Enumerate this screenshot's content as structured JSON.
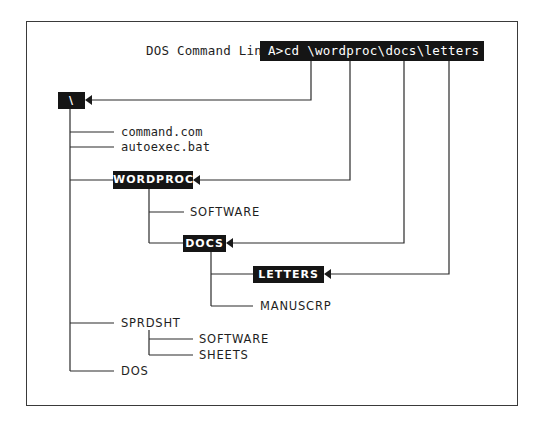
{
  "diagram": {
    "title_label": "DOS Command Line:",
    "command": "A>cd \\wordproc\\docs\\letters",
    "root": {
      "label": "\\"
    },
    "root_files": [
      "command.com",
      "autoexec.bat"
    ],
    "directories": {
      "wordproc": {
        "label": "WORDPROC",
        "children": [
          "SOFTWARE",
          "DOCS"
        ]
      },
      "docs": {
        "label": "DOCS",
        "children": [
          "LETTERS",
          "MANUSCRP"
        ]
      },
      "letters": {
        "label": "LETTERS"
      },
      "sprdsht": {
        "label": "SPRDSHT",
        "children": [
          "SOFTWARE",
          "SHEETS"
        ]
      },
      "dos": {
        "label": "DOS"
      }
    },
    "labels": {
      "wordproc_software": "SOFTWARE",
      "manuscrp": "MANUSCRP",
      "sprdsht": "SPRDSHT",
      "sprdsht_software": "SOFTWARE",
      "sheets": "SHEETS",
      "dos": "DOS"
    },
    "highlighted_path": [
      "\\",
      "WORDPROC",
      "DOCS",
      "LETTERS"
    ],
    "colors": {
      "highlight_bg": "#151515",
      "highlight_fg": "#ffffff",
      "line": "#2a2a2a",
      "background": "#ffffff"
    }
  }
}
